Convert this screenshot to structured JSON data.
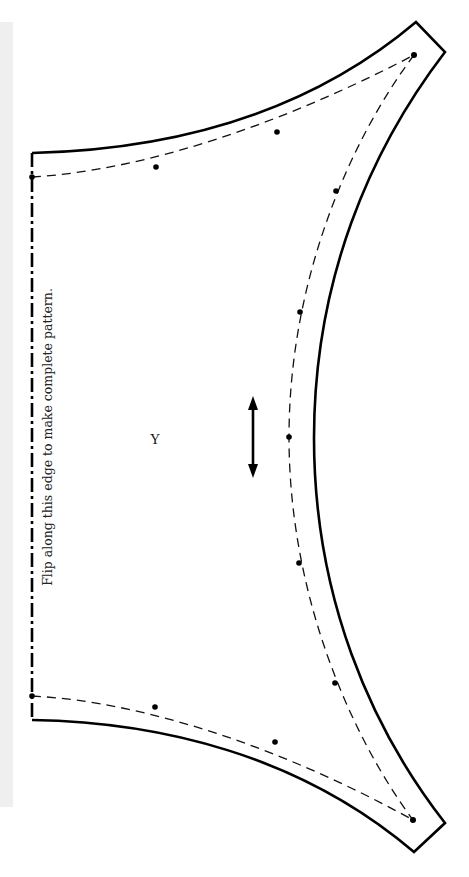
{
  "pattern": {
    "piece_label": "Y",
    "fold_instruction": "Flip along this edge to make complete pattern.",
    "grainline": "double-headed-arrow",
    "colors": {
      "cut_line": "#000000",
      "seam_line": "#111111",
      "side_strip": "#efefef",
      "background": "#ffffff"
    }
  }
}
